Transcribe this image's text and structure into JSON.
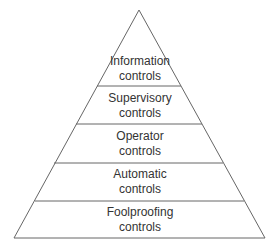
{
  "diagram": {
    "type": "pyramid",
    "line_color": "#666666",
    "text_color": "#333333",
    "tiers": [
      {
        "line1": "Information",
        "line2": "controls"
      },
      {
        "line1": "Supervisory",
        "line2": "controls"
      },
      {
        "line1": "Operator",
        "line2": "controls"
      },
      {
        "line1": "Automatic",
        "line2": "controls"
      },
      {
        "line1": "Foolproofing",
        "line2": "controls"
      }
    ]
  }
}
